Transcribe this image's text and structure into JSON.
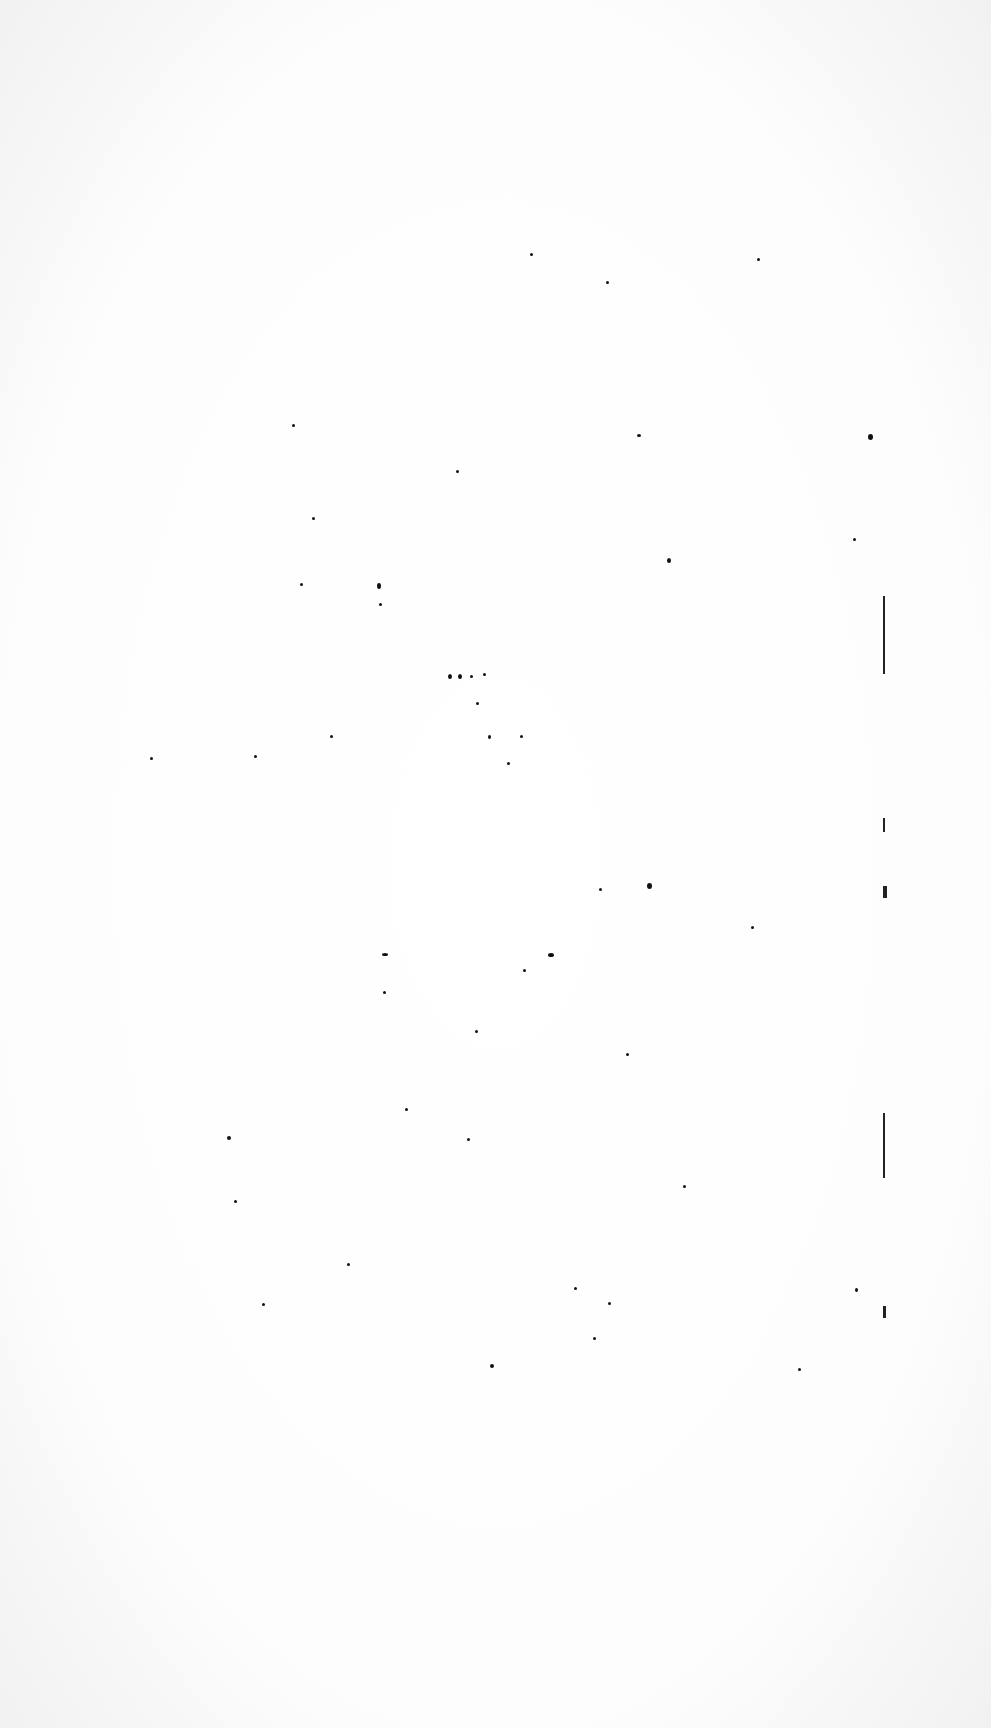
{
  "page": {
    "label": "Blank scanned page",
    "background": "#ffffff",
    "ink": "#111111"
  },
  "specks": [
    [
      530,
      253,
      3,
      3
    ],
    [
      757,
      258,
      3,
      3
    ],
    [
      606,
      281,
      3,
      3
    ],
    [
      292,
      424,
      3,
      3
    ],
    [
      637,
      434,
      4,
      3
    ],
    [
      868,
      434,
      5,
      6
    ],
    [
      456,
      470,
      3,
      3
    ],
    [
      312,
      517,
      3,
      3
    ],
    [
      667,
      558,
      4,
      5
    ],
    [
      853,
      538,
      3,
      3
    ],
    [
      377,
      583,
      4,
      6
    ],
    [
      300,
      583,
      3,
      3
    ],
    [
      379,
      603,
      3,
      3
    ],
    [
      448,
      674,
      4,
      5
    ],
    [
      458,
      674,
      4,
      5
    ],
    [
      470,
      675,
      3,
      3
    ],
    [
      483,
      673,
      3,
      3
    ],
    [
      476,
      702,
      3,
      3
    ],
    [
      330,
      735,
      3,
      3
    ],
    [
      488,
      735,
      3,
      4
    ],
    [
      520,
      735,
      3,
      3
    ],
    [
      507,
      762,
      3,
      3
    ],
    [
      254,
      755,
      3,
      3
    ],
    [
      150,
      757,
      3,
      3
    ],
    [
      647,
      883,
      5,
      6
    ],
    [
      599,
      888,
      3,
      3
    ],
    [
      751,
      926,
      3,
      3
    ],
    [
      548,
      953,
      6,
      4
    ],
    [
      523,
      969,
      3,
      3
    ],
    [
      382,
      953,
      6,
      3
    ],
    [
      383,
      991,
      3,
      3
    ],
    [
      475,
      1030,
      3,
      3
    ],
    [
      626,
      1053,
      3,
      3
    ],
    [
      227,
      1136,
      4,
      4
    ],
    [
      347,
      1263,
      3,
      3
    ],
    [
      574,
      1287,
      3,
      3
    ],
    [
      855,
      1288,
      3,
      4
    ],
    [
      262,
      1303,
      3,
      3
    ],
    [
      608,
      1302,
      3,
      3
    ],
    [
      593,
      1337,
      3,
      3
    ],
    [
      490,
      1364,
      4,
      4
    ],
    [
      798,
      1368,
      3,
      3
    ],
    [
      467,
      1138,
      3,
      3
    ],
    [
      405,
      1108,
      3,
      3
    ],
    [
      683,
      1185,
      3,
      3
    ],
    [
      234,
      1200,
      3,
      3
    ]
  ],
  "rules": [
    [
      883,
      596,
      2,
      78
    ],
    [
      883,
      1113,
      2,
      65
    ],
    [
      883,
      818,
      2,
      14
    ],
    [
      883,
      886,
      4,
      12
    ],
    [
      883,
      1306,
      3,
      12
    ]
  ]
}
